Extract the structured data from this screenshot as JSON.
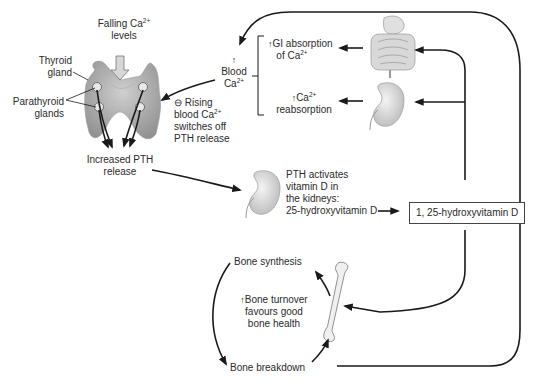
{
  "diagram": {
    "labels": {
      "falling_ca": {
        "line1_pre": "Falling Ca",
        "line1_sup": "2+",
        "line2": "levels"
      },
      "thyroid": {
        "line1": "Thyroid",
        "line2": "gland"
      },
      "parathyroid": {
        "line1": "Parathyroid",
        "line2": "glands"
      },
      "increased_pth": {
        "line1": "Increased PTH",
        "line2": "release"
      },
      "blood_ca": {
        "arrow": "↑",
        "line1": "Blood",
        "line2_pre": "Ca",
        "line2_sup": "2+"
      },
      "rising_feedback": {
        "symbol": "⊖",
        "line1": "Rising",
        "line2_pre": "blood Ca",
        "line2_sup": "2+",
        "line3": "switches off",
        "line4": "PTH release"
      },
      "gi_absorption": {
        "arrow": "↑",
        "line1": "GI absorption",
        "line2_pre": "of Ca",
        "line2_sup": "2+"
      },
      "reabsorption": {
        "arrow": "↑",
        "line1_pre": "Ca",
        "line1_sup": "2+",
        "line2": "reabsorption"
      },
      "pth_activates": {
        "line1": "PTH activates",
        "line2": "vitamin D in",
        "line3": "the kidneys:",
        "line4": "25-hydroxyvitamin D"
      },
      "active_vitd": "1, 25-hydroxyvitamin D",
      "bone_synthesis": "Bone synthesis",
      "bone_breakdown": "Bone breakdown",
      "bone_turnover": {
        "arrow": "↑",
        "line1": "Bone turnover",
        "line2": "favours good",
        "line3": "bone health"
      }
    },
    "icons": [
      "thyroid-gland-icon",
      "parathyroid-gland-icon",
      "intestine-icon",
      "kidney-icon",
      "bone-icon"
    ],
    "colors": {
      "line": "#1a1a1a",
      "organ_fill": "#c8c8c8",
      "organ_dark": "#9a9a9a",
      "text": "#2a2a2a"
    }
  }
}
